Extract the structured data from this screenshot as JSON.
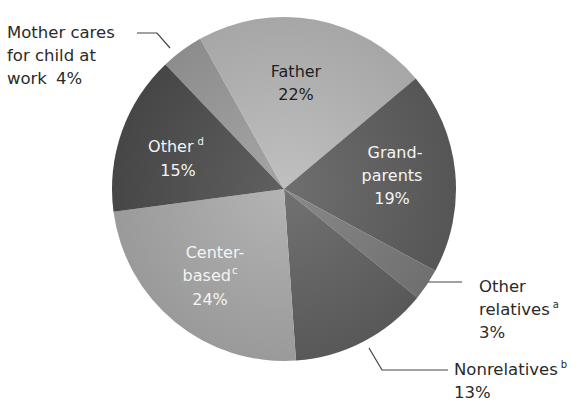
{
  "chart_data": {
    "type": "pie",
    "title": "",
    "start_angle_deg": -43.6,
    "direction": "clockwise",
    "slices": [
      {
        "key": "mother",
        "label": "Mother cares for child at work",
        "value": 4,
        "percent_label": "4%",
        "color": "#9c9c9c"
      },
      {
        "key": "father",
        "label": "Father",
        "value": 22,
        "percent_label": "22%",
        "color": "#b9b9b9"
      },
      {
        "key": "grandparents",
        "label": "Grandparents",
        "value": 19,
        "percent_label": "19%",
        "color": "#5f5f5f"
      },
      {
        "key": "other_relatives",
        "label": "Other relatives",
        "footnote": "a",
        "value": 3,
        "percent_label": "3%",
        "color": "#7c7c7c"
      },
      {
        "key": "nonrelatives",
        "label": "Nonrelatives",
        "footnote": "b",
        "value": 13,
        "percent_label": "13%",
        "color": "#626262"
      },
      {
        "key": "center_based",
        "label": "Center-based",
        "footnote": "c",
        "value": 24,
        "percent_label": "24%",
        "color": "#ababab"
      },
      {
        "key": "other",
        "label": "Other",
        "footnote": "d",
        "value": 15,
        "percent_label": "15%",
        "color": "#4e4e4e"
      }
    ]
  },
  "labels": {
    "mother": {
      "line1": "Mother cares",
      "line2": "for child at",
      "line3": "work",
      "pct": "4%"
    },
    "father": {
      "line1": "Father",
      "pct": "22%"
    },
    "grandparents": {
      "line1": "Grand-",
      "line2": "parents",
      "pct": "19%"
    },
    "other_relatives": {
      "line1": "Other",
      "line2": "relatives",
      "sup": "a",
      "pct": "3%"
    },
    "nonrelatives": {
      "line1": "Nonrelatives",
      "sup": "b",
      "pct": "13%"
    },
    "center_based": {
      "line1": "Center-",
      "line2": "based",
      "sup": "c",
      "pct": "24%"
    },
    "other": {
      "line1": "Other",
      "sup": "d",
      "pct": "15%"
    }
  }
}
